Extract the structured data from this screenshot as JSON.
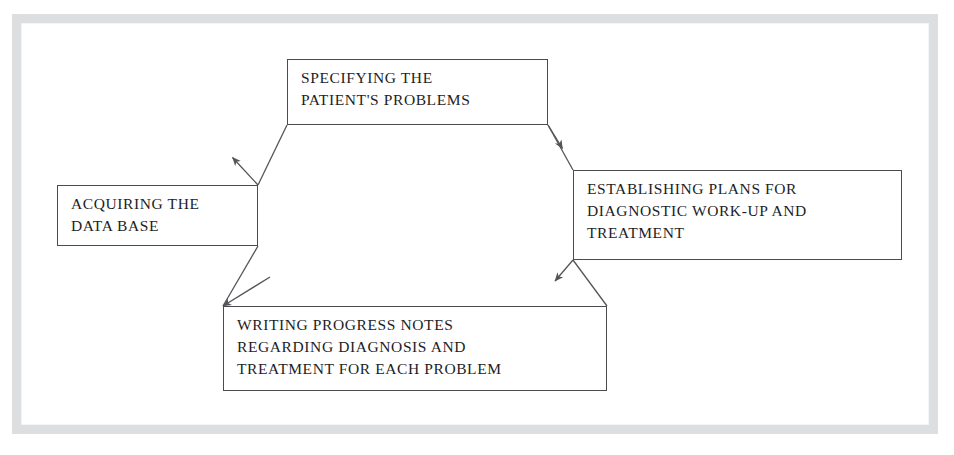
{
  "figure": {
    "kind": "cycle-flow-diagram",
    "frame": {
      "border_color": "#dcdee0",
      "background": "#ffffff"
    },
    "nodes": [
      {
        "id": "specifying",
        "label": "SPECIFYING THE\nPATIENT'S PROBLEMS",
        "position": "top"
      },
      {
        "id": "acquiring",
        "label": "ACQUIRING THE\nDATA BASE",
        "position": "left"
      },
      {
        "id": "establishing",
        "label": "ESTABLISHING PLANS FOR\nDIAGNOSTIC WORK-UP AND\nTREATMENT",
        "position": "right"
      },
      {
        "id": "writing",
        "label": "WRITING PROGRESS NOTES\nREGARDING DIAGNOSIS AND\nTREATMENT FOR EACH PROBLEM",
        "position": "bottom"
      }
    ],
    "connectors": [
      {
        "id": "acquiring-to-specifying",
        "from": "acquiring",
        "to": "specifying",
        "direction": "up-right",
        "arrowhead": "midpoint",
        "line_color": "#55555a"
      },
      {
        "id": "specifying-to-establishing",
        "from": "specifying",
        "to": "establishing",
        "direction": "down-right",
        "arrowhead": "midpoint",
        "line_color": "#55555a"
      },
      {
        "id": "establishing-to-writing",
        "from": "establishing",
        "to": "writing",
        "direction": "down-left",
        "arrowhead": "midpoint",
        "line_color": "#55555a"
      },
      {
        "id": "writing-to-acquiring",
        "from": "writing",
        "to": "acquiring",
        "direction": "up-left",
        "arrowhead": "midpoint",
        "line_color": "#55555a"
      }
    ]
  }
}
